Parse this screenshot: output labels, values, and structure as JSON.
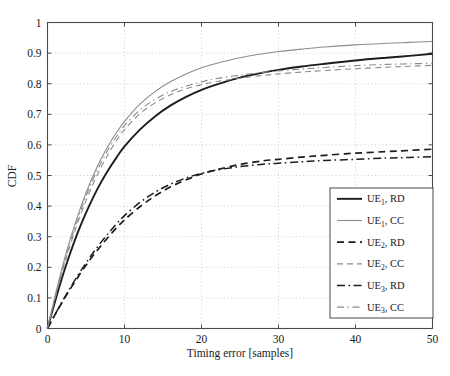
{
  "chart_data": {
    "type": "line",
    "title": "",
    "subtitle": "",
    "xlabel": "Timing error [samples]",
    "ylabel": "CDF",
    "xlim": [
      0,
      50
    ],
    "ylim": [
      0,
      1
    ],
    "xticks": [
      0,
      10,
      20,
      30,
      40,
      50
    ],
    "xtick_labels": [
      "0",
      "10",
      "20",
      "30",
      "40",
      "50"
    ],
    "yticks": [
      0,
      0.1,
      0.2,
      0.3,
      0.4,
      0.5,
      0.6,
      0.7,
      0.8,
      0.9,
      1
    ],
    "ytick_labels": [
      "0",
      "0.1",
      "0.2",
      "0.3",
      "0.4",
      "0.5",
      "0.6",
      "0.7",
      "0.8",
      "0.9",
      "1"
    ],
    "grid": true,
    "grid_style": "dotted",
    "legend_position": "lower-right",
    "x": [
      0,
      1,
      2,
      3,
      4,
      5,
      6,
      7,
      8,
      9,
      10,
      12,
      14,
      16,
      18,
      20,
      22,
      25,
      28,
      30,
      33,
      36,
      40,
      44,
      47,
      50
    ],
    "series": [
      {
        "name": "UE_1, RD",
        "label_base": "UE",
        "label_sub": "1",
        "label_tail": ", RD",
        "style": "solid",
        "width": 1.9,
        "color": "#1c1c1c",
        "values": [
          0.0,
          0.09,
          0.175,
          0.25,
          0.318,
          0.378,
          0.432,
          0.48,
          0.522,
          0.56,
          0.595,
          0.65,
          0.694,
          0.729,
          0.757,
          0.78,
          0.798,
          0.82,
          0.836,
          0.845,
          0.856,
          0.865,
          0.876,
          0.885,
          0.891,
          0.898
        ]
      },
      {
        "name": "UE_1, CC",
        "label_base": "UE",
        "label_sub": "1",
        "label_tail": ", CC",
        "style": "solid",
        "width": 1.1,
        "color": "#8c8c8c",
        "values": [
          0.0,
          0.108,
          0.208,
          0.296,
          0.374,
          0.443,
          0.503,
          0.556,
          0.602,
          0.642,
          0.677,
          0.733,
          0.775,
          0.807,
          0.832,
          0.852,
          0.867,
          0.885,
          0.898,
          0.905,
          0.913,
          0.92,
          0.927,
          0.932,
          0.935,
          0.938
        ]
      },
      {
        "name": "UE_2, RD",
        "label_base": "UE",
        "label_sub": "2",
        "label_tail": ", RD",
        "style": "dashed",
        "width": 1.7,
        "color": "#1c1c1c",
        "values": [
          0.0,
          0.046,
          0.09,
          0.131,
          0.17,
          0.207,
          0.241,
          0.272,
          0.302,
          0.33,
          0.355,
          0.398,
          0.434,
          0.463,
          0.486,
          0.505,
          0.519,
          0.536,
          0.548,
          0.553,
          0.56,
          0.566,
          0.573,
          0.578,
          0.582,
          0.586
        ]
      },
      {
        "name": "UE_2, CC",
        "label_base": "UE",
        "label_sub": "2",
        "label_tail": ", CC",
        "style": "dashed",
        "width": 1.1,
        "color": "#8c8c8c",
        "values": [
          0.0,
          0.1,
          0.193,
          0.276,
          0.351,
          0.418,
          0.477,
          0.529,
          0.575,
          0.615,
          0.65,
          0.702,
          0.738,
          0.764,
          0.783,
          0.797,
          0.807,
          0.818,
          0.827,
          0.832,
          0.838,
          0.843,
          0.849,
          0.854,
          0.857,
          0.86
        ]
      },
      {
        "name": "UE_3, RD",
        "label_base": "UE",
        "label_sub": "3",
        "label_tail": ", RD",
        "style": "dashdot",
        "width": 1.5,
        "color": "#1c1c1c",
        "values": [
          0.0,
          0.047,
          0.092,
          0.135,
          0.176,
          0.214,
          0.25,
          0.283,
          0.314,
          0.343,
          0.369,
          0.412,
          0.446,
          0.472,
          0.492,
          0.507,
          0.518,
          0.529,
          0.537,
          0.54,
          0.545,
          0.549,
          0.553,
          0.557,
          0.559,
          0.561
        ]
      },
      {
        "name": "UE_3, CC",
        "label_base": "UE",
        "label_sub": "3",
        "label_tail": ", CC",
        "style": "dashdot",
        "width": 1.1,
        "color": "#8c8c8c",
        "values": [
          0.0,
          0.104,
          0.2,
          0.286,
          0.363,
          0.432,
          0.492,
          0.544,
          0.59,
          0.629,
          0.663,
          0.714,
          0.749,
          0.774,
          0.792,
          0.806,
          0.817,
          0.828,
          0.837,
          0.842,
          0.848,
          0.853,
          0.859,
          0.863,
          0.865,
          0.867
        ]
      }
    ]
  },
  "legend": {
    "entries": [
      {
        "text": "UE",
        "sub": "1",
        "tail": ", RD"
      },
      {
        "text": "UE",
        "sub": "1",
        "tail": ", CC"
      },
      {
        "text": "UE",
        "sub": "2",
        "tail": ", RD"
      },
      {
        "text": "UE",
        "sub": "2",
        "tail": ", CC"
      },
      {
        "text": "UE",
        "sub": "3",
        "tail": ", RD"
      },
      {
        "text": "UE",
        "sub": "3",
        "tail": ", CC"
      }
    ]
  },
  "colors": {
    "dark_line": "#1c1c1c",
    "gray_line": "#8c8c8c",
    "axis": "#4a4a4a",
    "grid": "#b9b9b9",
    "background": "#ffffff"
  }
}
